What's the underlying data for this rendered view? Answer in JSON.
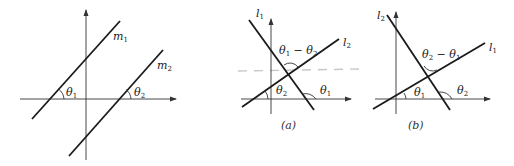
{
  "figures": [
    {
      "id": "parallel",
      "lines": [
        {
          "name": "m",
          "sub": "1"
        },
        {
          "name": "m",
          "sub": "2"
        }
      ],
      "angles": [
        {
          "name": "θ",
          "sub": "1"
        },
        {
          "name": "θ",
          "sub": "2"
        }
      ],
      "caption": ""
    },
    {
      "id": "a",
      "lines": [
        {
          "name": "l",
          "sub": "1"
        },
        {
          "name": "l",
          "sub": "2"
        }
      ],
      "angles": [
        {
          "name": "θ",
          "sub": "1"
        },
        {
          "name": "θ",
          "sub": "2"
        }
      ],
      "between_angle": {
        "a": "θ",
        "a_sub": "1",
        "op": " − ",
        "b": "θ",
        "b_sub": "2"
      },
      "caption": "(a)"
    },
    {
      "id": "b",
      "lines": [
        {
          "name": "l",
          "sub": "1"
        },
        {
          "name": "l",
          "sub": "2"
        }
      ],
      "angles": [
        {
          "name": "θ",
          "sub": "1"
        },
        {
          "name": "θ",
          "sub": "2"
        }
      ],
      "between_angle": {
        "a": "θ",
        "a_sub": "2",
        "op": " − ",
        "b": "θ",
        "b_sub": "1"
      },
      "caption": "(b)"
    }
  ],
  "colors": {
    "line": "#1a1a1a",
    "axis": "#333333",
    "dashed_artifact": "#c8c8c8"
  }
}
